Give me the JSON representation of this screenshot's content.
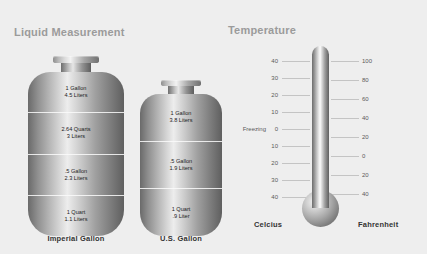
{
  "liquid": {
    "title": "Liquid Measurement",
    "containers": [
      {
        "caption": "Imperial Gallon",
        "bands": [
          {
            "line1": "1 Gallon",
            "line2": "4.5 Liters"
          },
          {
            "line1": "2.64 Quarts",
            "line2": "3 Liters"
          },
          {
            "line1": ".5 Gallon",
            "line2": "2.3 Liters"
          },
          {
            "line1": "1 Quart",
            "line2": "1.1 Liters"
          }
        ]
      },
      {
        "caption": "U.S. Gallon",
        "bands": [
          {
            "line1": "1 Gallon",
            "line2": "3.8 Liters"
          },
          {
            "line1": ".5 Gallon",
            "line2": "1.9 Liters"
          },
          {
            "line1": "1 Quart",
            "line2": ".9 Liter"
          }
        ]
      }
    ]
  },
  "temperature": {
    "title": "Temperature",
    "freezing_label": "Freezing",
    "celsius_caption": "Celcius",
    "fahrenheit_caption": "Fahrenheit",
    "celsius_ticks": [
      "40",
      "30",
      "20",
      "10",
      "0",
      "10",
      "20",
      "30",
      "40"
    ],
    "fahrenheit_ticks": [
      "100",
      "80",
      "60",
      "40",
      "20",
      "0",
      "20",
      "40"
    ]
  },
  "colors": {
    "background": "#eeeeee",
    "title_gray": "#9b9b9b",
    "caption_dark": "#333333",
    "tick_gray": "#c4c4c4",
    "metal_light": "#f2f2f2",
    "metal_dark": "#5f5f5f"
  }
}
